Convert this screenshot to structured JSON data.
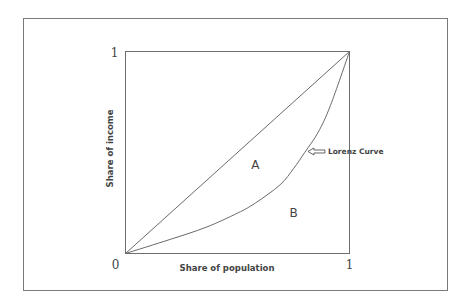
{
  "chart_data": {
    "type": "line",
    "title": "",
    "xlabel": "Share of population",
    "ylabel": "Share of income",
    "xlim": [
      0,
      1
    ],
    "ylim": [
      0,
      1
    ],
    "grid": false,
    "x_ticks": [
      "0",
      "1"
    ],
    "y_ticks": [
      "1"
    ],
    "origin_label": "0",
    "series": [
      {
        "name": "Line of equality",
        "x": [
          0,
          1
        ],
        "y": [
          0,
          1
        ]
      },
      {
        "name": "Lorenz Curve",
        "x": [
          0,
          0.2,
          0.36,
          0.5,
          0.58,
          0.69,
          0.75,
          0.8,
          0.86,
          0.915,
          1
        ],
        "y": [
          0,
          0.07,
          0.13,
          0.2,
          0.25,
          0.34,
          0.42,
          0.5,
          0.6,
          0.733,
          1
        ]
      }
    ],
    "regions": [
      {
        "label": "A",
        "x": 0.58,
        "y": 0.44
      },
      {
        "label": "B",
        "x": 0.75,
        "y": 0.2
      }
    ],
    "annotations": [
      {
        "text": "Lorenz Curve",
        "arrow": "left",
        "points_to": {
          "x": 0.81,
          "y": 0.505
        }
      }
    ]
  }
}
